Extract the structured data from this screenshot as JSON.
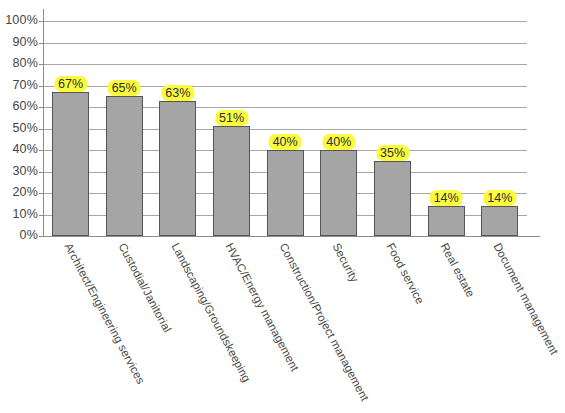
{
  "chart_data": {
    "type": "bar",
    "title": "",
    "subtitle": "",
    "xlabel": "",
    "ylabel": "",
    "ylim": [
      0,
      100
    ],
    "grid": true,
    "legend": "none",
    "orientation": "vertical",
    "value_suffix": "%",
    "categories": [
      "Architect/Engineering services",
      "Custodial/Janitorial",
      "Landscaping/Groundskeeping",
      "HVAC/Energy management",
      "Construction/Project management",
      "Security",
      "Food service",
      "Real estate",
      "Document management"
    ],
    "values": [
      67,
      65,
      63,
      51,
      40,
      40,
      35,
      14,
      14
    ],
    "data_labels": [
      "67%",
      "65%",
      "63%",
      "51%",
      "40%",
      "40%",
      "35%",
      "14%",
      "14%"
    ],
    "y_ticks": [
      0,
      10,
      20,
      30,
      40,
      50,
      60,
      70,
      80,
      90,
      100
    ],
    "y_tick_labels": [
      "0%",
      "10%",
      "20%",
      "30%",
      "40%",
      "50%",
      "60%",
      "70%",
      "80%",
      "90%",
      "100%"
    ],
    "colors": {
      "bar_fill": "#a5a5a5",
      "bar_border": "#555555",
      "gridline": "#a8a8a8",
      "axis": "#8d8d8d",
      "label_highlight": "#fbfb3d",
      "label_text": "#2e2e2e",
      "tick_text": "#444444",
      "background": "#ffffff"
    }
  }
}
